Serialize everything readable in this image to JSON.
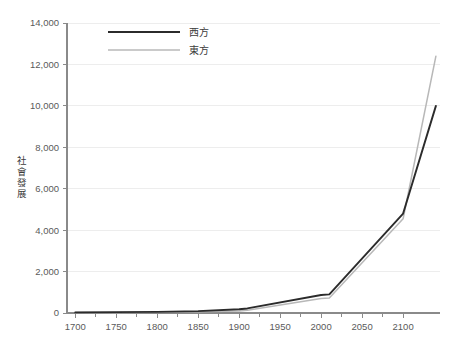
{
  "chart_data": {
    "type": "line",
    "title": "",
    "xlabel": "",
    "ylabel": "社會發展",
    "xlim": [
      1690,
      2145
    ],
    "ylim": [
      0,
      14000
    ],
    "grid": true,
    "legend_position": "top-center",
    "x_ticks": [
      1700,
      1750,
      1800,
      1850,
      1900,
      1950,
      2000,
      2050,
      2100
    ],
    "x_tick_labels": [
      "1700",
      "1750",
      "1800",
      "1850",
      "1900",
      "1950",
      "2000",
      "2050",
      "2100"
    ],
    "x_minor_tick_interval": 25,
    "y_ticks": [
      0,
      2000,
      4000,
      6000,
      8000,
      10000,
      12000,
      14000
    ],
    "y_tick_labels": [
      "0",
      "2,000",
      "4,000",
      "6,000",
      "8,000",
      "10,000",
      "12,000",
      "14,000"
    ],
    "x": [
      1700,
      1750,
      1800,
      1850,
      1900,
      1910,
      2000,
      2010,
      2100,
      2140
    ],
    "series": [
      {
        "name": "西方",
        "color": "#2b2b2b",
        "values": [
          30,
          40,
          55,
          90,
          180,
          220,
          870,
          900,
          4800,
          10000
        ]
      },
      {
        "name": "東方",
        "color": "#b8b8b8",
        "values": [
          25,
          30,
          38,
          55,
          100,
          130,
          700,
          720,
          4550,
          12400
        ]
      }
    ]
  },
  "legend": {
    "items": [
      {
        "label": "西方",
        "color": "#2b2b2b"
      },
      {
        "label": "東方",
        "color": "#b8b8b8"
      }
    ]
  },
  "axis": {
    "y_title_chars": [
      "社",
      "會",
      "發",
      "展"
    ],
    "axis_color": "#8a8a8a",
    "grid_color": "#ededed",
    "tick_text_color": "#5a5a5a"
  }
}
